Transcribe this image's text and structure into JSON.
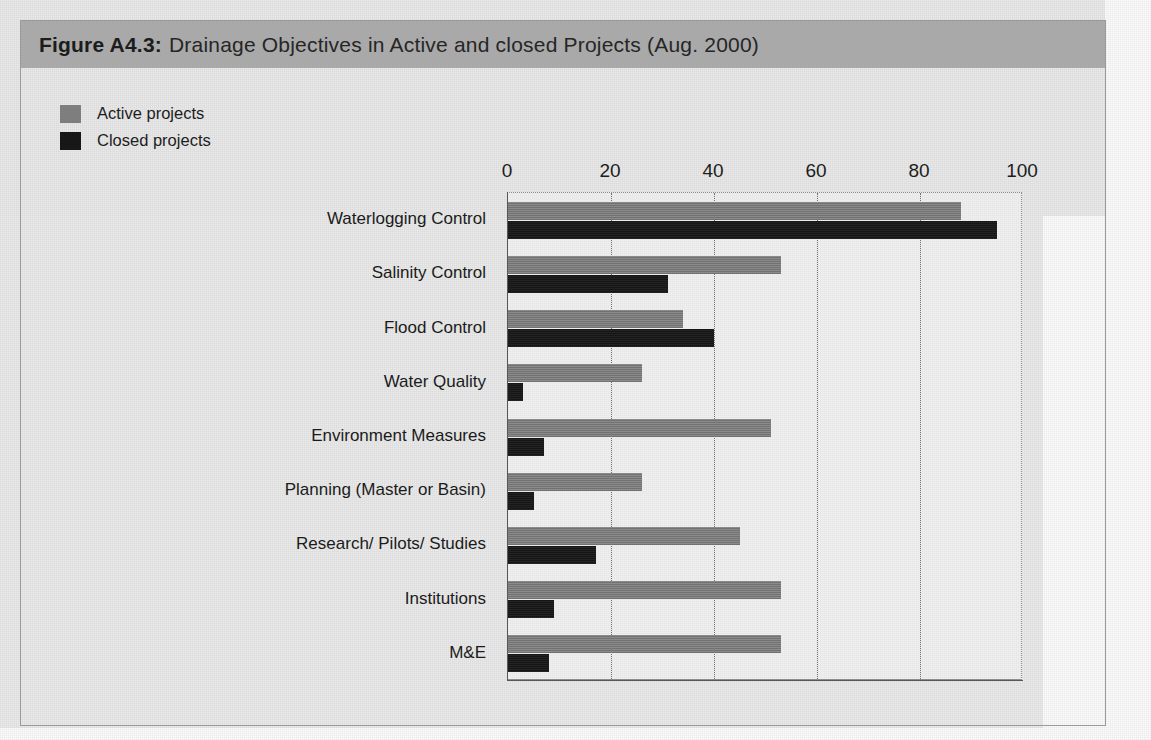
{
  "figure": {
    "number": "Figure A4.3:",
    "title": "Drainage Objectives in Active and closed Projects (Aug. 2000)"
  },
  "legend": {
    "position": "top-left",
    "items": [
      {
        "label": "Active projects",
        "color": "#7e7e7e",
        "key": "active"
      },
      {
        "label": "Closed projects",
        "color": "#171717",
        "key": "closed"
      }
    ]
  },
  "chart_data": {
    "type": "bar",
    "orientation": "horizontal",
    "title": "Drainage Objectives in Active and closed Projects (Aug. 2000)",
    "xlabel": "",
    "ylabel": "",
    "xlim": [
      0,
      100
    ],
    "xticks": [
      0,
      20,
      40,
      60,
      80,
      100
    ],
    "xtick_labels": [
      "0",
      "20",
      "40",
      "60",
      "80",
      "100"
    ],
    "grid": "vertical-dotted",
    "legend_position": "top-left",
    "categories": [
      "Waterlogging Control",
      "Salinity Control",
      "Flood Control",
      "Water Quality",
      "Environment Measures",
      "Planning (Master or Basin)",
      "Research/ Pilots/ Studies",
      "Institutions",
      "M&E"
    ],
    "series": [
      {
        "name": "Active projects",
        "color": "#7e7e7e",
        "values": [
          88,
          53,
          34,
          26,
          51,
          26,
          45,
          53,
          53
        ]
      },
      {
        "name": "Closed projects",
        "color": "#171717",
        "values": [
          95,
          31,
          40,
          3,
          7,
          5,
          17,
          9,
          8
        ]
      }
    ]
  }
}
